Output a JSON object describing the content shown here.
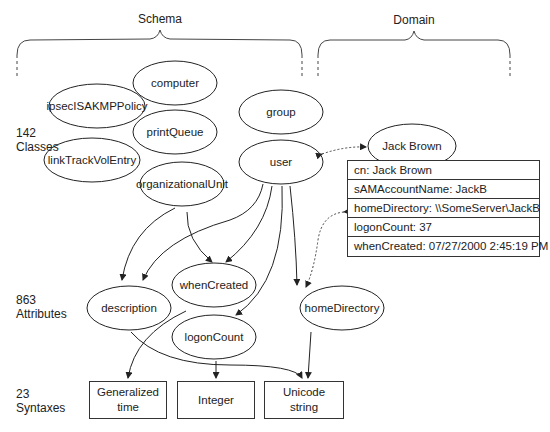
{
  "headers": {
    "schema": "Schema",
    "domain": "Domain"
  },
  "row_labels": {
    "classes": {
      "count": "142",
      "name": "Classes"
    },
    "attributes": {
      "count": "863",
      "name": "Attributes"
    },
    "syntaxes": {
      "count": "23",
      "name": "Syntaxes"
    }
  },
  "classes": [
    {
      "id": "computer",
      "label": "computer"
    },
    {
      "id": "ipsec",
      "label": "ipsecISAKMPPolicy"
    },
    {
      "id": "group",
      "label": "group"
    },
    {
      "id": "printQueue",
      "label": "printQueue"
    },
    {
      "id": "linkTrack",
      "label": "linkTrackVolEntry"
    },
    {
      "id": "user",
      "label": "user"
    },
    {
      "id": "orgUnit",
      "label": "organizationalUnit"
    }
  ],
  "attributes": [
    {
      "id": "whenCreated",
      "label": "whenCreated"
    },
    {
      "id": "description",
      "label": "description"
    },
    {
      "id": "homeDirectory",
      "label": "homeDirectory"
    },
    {
      "id": "logonCount",
      "label": "logonCount"
    }
  ],
  "syntaxes": [
    {
      "id": "gentime",
      "line1": "Generalized",
      "line2": "time"
    },
    {
      "id": "integer",
      "line1": "Integer",
      "line2": ""
    },
    {
      "id": "unicode",
      "line1": "Unicode",
      "line2": "string"
    }
  ],
  "domain_object": {
    "name": "Jack Brown",
    "attributes": [
      "cn: Jack Brown",
      "sAMAccountName: JackB",
      "homeDirectory: \\\\SomeServer\\JackB",
      "logonCount: 37",
      "whenCreated: 07/27/2000 2:45:19 PM"
    ]
  }
}
